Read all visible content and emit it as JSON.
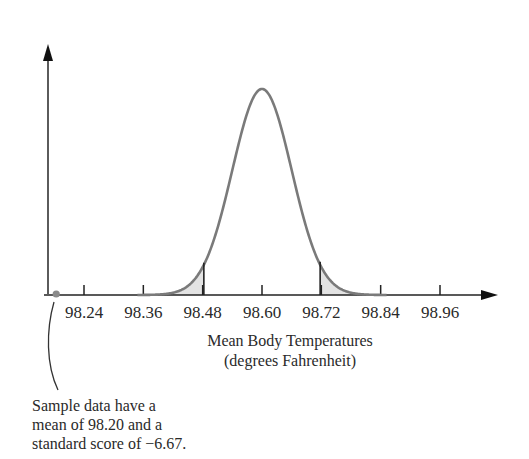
{
  "chart_data": {
    "type": "line",
    "subtype": "normal-distribution-curve",
    "title": "",
    "xlabel": "Mean Body Temperatures",
    "xlabel_sub": "(degrees Fahrenheit)",
    "ylabel": "",
    "x_ticks": [
      "98.24",
      "98.36",
      "98.48",
      "98.60",
      "98.72",
      "98.84",
      "98.96"
    ],
    "x_tick_values": [
      98.24,
      98.36,
      98.48,
      98.6,
      98.72,
      98.84,
      98.96
    ],
    "distribution": {
      "mean": 98.6,
      "std": 0.06
    },
    "critical_values": [
      98.48,
      98.72
    ],
    "shaded_regions": [
      "left tail below ~98.48",
      "right tail above ~98.72"
    ],
    "sample_point": {
      "x": 98.2,
      "z": -6.67
    },
    "annotation": [
      "Sample data have a",
      "mean of 98.20 and a",
      "standard score of −6.67."
    ],
    "grid": false,
    "legend": null,
    "colors": {
      "curve": "#7a7a7a",
      "shade": "#e3e3e3",
      "axis": "#1a1a1a",
      "point": "#8a8a8a"
    }
  }
}
